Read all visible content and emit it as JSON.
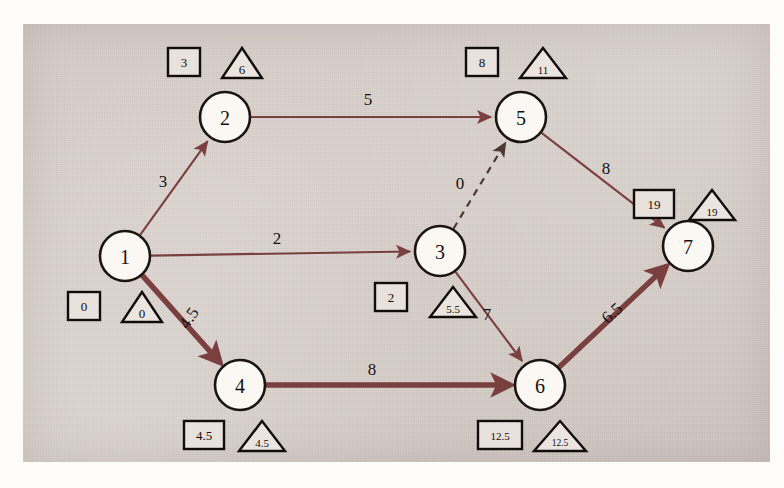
{
  "diagram": {
    "background_color": "#d5ccc6",
    "edge_color": "#7a4040",
    "node_fill": "#fbf8f4",
    "node_stroke": "#1b1512",
    "dummy_color": "#4b3832"
  },
  "nodes": [
    {
      "id": "1",
      "label": "1",
      "cx": 125,
      "cy": 256,
      "r": 25,
      "earliest": "0",
      "latest": "0",
      "box": {
        "x": 68,
        "y": 292
      },
      "tri": {
        "x": 122,
        "y": 292
      }
    },
    {
      "id": "2",
      "label": "2",
      "cx": 225,
      "cy": 117,
      "r": 25,
      "earliest": "3",
      "latest": "6",
      "box": {
        "x": 168,
        "y": 48
      },
      "tri": {
        "x": 222,
        "y": 48
      }
    },
    {
      "id": "3",
      "label": "3",
      "cx": 440,
      "cy": 251,
      "r": 25,
      "earliest": "2",
      "latest": "5.5",
      "box": {
        "x": 375,
        "y": 283
      },
      "tri": {
        "x": 430,
        "y": 287
      }
    },
    {
      "id": "4",
      "label": "4",
      "cx": 240,
      "cy": 385,
      "r": 25,
      "earliest": "4.5",
      "latest": "4.5",
      "box": {
        "x": 184,
        "y": 421
      },
      "tri": {
        "x": 239,
        "y": 421
      }
    },
    {
      "id": "5",
      "label": "5",
      "cx": 521,
      "cy": 117,
      "r": 25,
      "earliest": "8",
      "latest": "11",
      "box": {
        "x": 466,
        "y": 48
      },
      "tri": {
        "x": 520,
        "y": 48
      }
    },
    {
      "id": "6",
      "label": "6",
      "cx": 540,
      "cy": 385,
      "r": 25,
      "earliest": "12.5",
      "latest": "12.5",
      "box": {
        "x": 478,
        "y": 421
      },
      "tri": {
        "x": 534,
        "y": 421
      }
    },
    {
      "id": "7",
      "label": "7",
      "cx": 688,
      "cy": 246,
      "r": 25,
      "earliest": "19",
      "latest": "19",
      "box": {
        "x": 634,
        "y": 190
      },
      "tri": {
        "x": 689,
        "y": 190
      }
    }
  ],
  "edges": [
    {
      "id": "e12",
      "from": "1",
      "to": "2",
      "weight": "3",
      "style": "thin",
      "label_x": 163,
      "label_y": 181
    },
    {
      "id": "e25",
      "from": "2",
      "to": "5",
      "weight": "5",
      "style": "thin",
      "label_x": 368,
      "label_y": 99
    },
    {
      "id": "e13",
      "from": "1",
      "to": "3",
      "weight": "2",
      "style": "thin",
      "label_x": 277,
      "label_y": 238
    },
    {
      "id": "e35",
      "from": "3",
      "to": "5",
      "weight": "0",
      "style": "dashed",
      "label_x": 460,
      "label_y": 183
    },
    {
      "id": "e57",
      "from": "5",
      "to": "7",
      "weight": "8",
      "style": "thin",
      "label_x": 606,
      "label_y": 168
    },
    {
      "id": "e14",
      "from": "1",
      "to": "4",
      "weight": "4.5",
      "style": "thick",
      "label_x": 189,
      "label_y": 318,
      "rotate": -56
    },
    {
      "id": "e46",
      "from": "4",
      "to": "6",
      "weight": "8",
      "style": "thick",
      "label_x": 372,
      "label_y": 369
    },
    {
      "id": "e36",
      "from": "3",
      "to": "6",
      "weight": "7",
      "style": "thin",
      "label_x": 487,
      "label_y": 314
    },
    {
      "id": "e67",
      "from": "6",
      "to": "7",
      "weight": "6.5",
      "style": "thick",
      "label_x": 612,
      "label_y": 313,
      "rotate": -42
    }
  ],
  "critical_path": [
    "1",
    "4",
    "6",
    "7"
  ]
}
